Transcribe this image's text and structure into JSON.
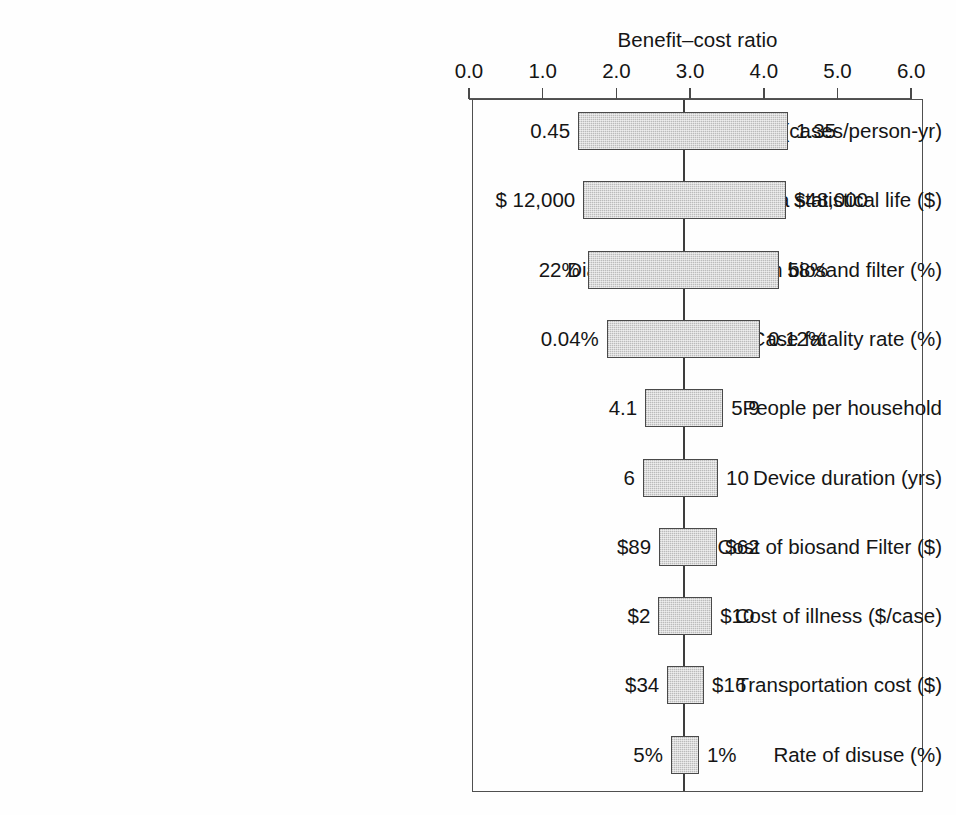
{
  "chart_data": {
    "type": "bar",
    "subtype": "tornado-diagram",
    "title": "Benefit–cost ratio",
    "xlabel": "Benefit–cost ratio",
    "ylabel": "",
    "xlim": [
      0.0,
      6.0
    ],
    "xticks": [
      "0.0",
      "1.0",
      "2.0",
      "3.0",
      "4.0",
      "5.0",
      "6.0"
    ],
    "xtick_values": [
      0.0,
      1.0,
      2.0,
      3.0,
      4.0,
      5.0,
      6.0
    ],
    "grid": false,
    "legend": false,
    "baseline": 2.9,
    "categories": [
      "Diarrheal incidence (cases/person-yr)",
      "Value of a statistical life ($)",
      "Diarrhea reduction from biosand filter (%)",
      "Case fatality rate (%)",
      "People per household",
      "Device duration (yrs)",
      "Cost of biosand Filter ($)",
      "Cost of illness ($/case)",
      "Transportation cost ($)",
      "Rate of disuse (%)"
    ],
    "bars": [
      {
        "label": "Diarrheal incidence (cases/person-yr)",
        "low": 1.48,
        "high": 4.33,
        "low_text": "0.45",
        "high_text": "1.35"
      },
      {
        "label": "Value of a statistical life ($)",
        "low": 1.55,
        "high": 4.3,
        "low_text": "$ 12,000",
        "high_text": "$48,000"
      },
      {
        "label": "Diarrhea reduction from biosand filter (%)",
        "low": 1.61,
        "high": 4.21,
        "low_text": "22%",
        "high_text": "58%"
      },
      {
        "label": "Case fatality rate (%)",
        "low": 1.87,
        "high": 3.95,
        "low_text": "0.04%",
        "high_text": "0.12%"
      },
      {
        "label": "People per household",
        "low": 2.39,
        "high": 3.45,
        "low_text": "4.1",
        "high_text": "5.9"
      },
      {
        "label": "Device duration (yrs)",
        "low": 2.36,
        "high": 3.38,
        "low_text": "6",
        "high_text": "10"
      },
      {
        "label": "Cost of biosand Filter ($)",
        "low": 2.58,
        "high": 3.37,
        "low_text": "$89",
        "high_text": "$62"
      },
      {
        "label": "Cost of illness ($/case)",
        "low": 2.57,
        "high": 3.3,
        "low_text": "$2",
        "high_text": "$10"
      },
      {
        "label": "Transportation cost ($)",
        "low": 2.69,
        "high": 3.19,
        "low_text": "$34",
        "high_text": "$16"
      },
      {
        "label": "Rate of disuse (%)",
        "low": 2.74,
        "high": 3.12,
        "low_text": "5%",
        "high_text": "1%"
      }
    ],
    "colors": {
      "bar_fill": "#c6c6c6",
      "bar_border": "#4a4a4a",
      "axis": "#4f4f4f",
      "text": "#151515",
      "background": "#fefefe"
    }
  }
}
